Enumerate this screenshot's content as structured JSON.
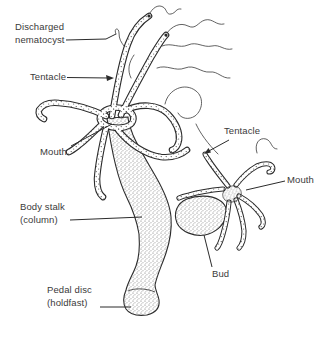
{
  "colors": {
    "ink": "#2b2b2b",
    "label_text": "#3a3a3a",
    "background": "#ffffff"
  },
  "labels": {
    "discharged_nematocyst": {
      "line1": "Discharged",
      "line2": "nematocyst"
    },
    "tentacle_left": {
      "text": "Tentacle"
    },
    "mouth_left": {
      "text": "Mouth"
    },
    "body_stalk": {
      "line1": "Body stalk",
      "line2": "(column)"
    },
    "pedal_disc": {
      "line1": "Pedal disc",
      "line2": "(holdfast)"
    },
    "tentacle_right": {
      "text": "Tentacle"
    },
    "mouth_right": {
      "text": "Mouth"
    },
    "bud": {
      "text": "Bud"
    }
  }
}
